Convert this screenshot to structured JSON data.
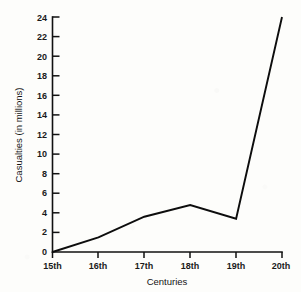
{
  "chart_data": {
    "type": "line",
    "title": "",
    "xlabel": "Centuries",
    "ylabel": "Casualties (in millions)",
    "categories": [
      "15th",
      "16th",
      "17th",
      "18th",
      "19th",
      "20th"
    ],
    "values": [
      0,
      1.5,
      3.6,
      4.8,
      3.4,
      24
    ],
    "series": [
      {
        "name": "Casualties",
        "values": [
          0,
          1.5,
          3.6,
          4.8,
          3.4,
          24
        ],
        "color": "#0d0d0d"
      }
    ],
    "ylim": [
      0,
      24
    ],
    "xlim_categories": [
      "15th",
      "20th"
    ],
    "ytick_labels": [
      "0",
      "2",
      "4",
      "6",
      "8",
      "10",
      "12",
      "14",
      "16",
      "18",
      "20",
      "22",
      "24"
    ],
    "ytick_values": [
      0,
      2,
      4,
      6,
      8,
      10,
      12,
      14,
      16,
      18,
      20,
      22,
      24
    ],
    "xtick_labels": [
      "15th",
      "16th",
      "17th",
      "18th",
      "19th",
      "20th"
    ],
    "grid": false,
    "legend": false,
    "legend_position": "none",
    "annotations": [],
    "background_color": "#fdfdfb",
    "axis_color": "#111111"
  }
}
